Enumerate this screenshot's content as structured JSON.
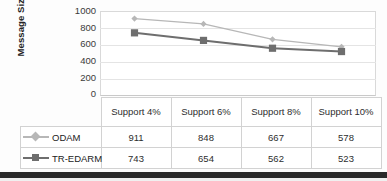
{
  "chart_data": {
    "type": "line",
    "title": "",
    "xlabel": "",
    "ylabel": "Message Size",
    "ylim": [
      0,
      1000
    ],
    "y_ticks": [
      1000,
      800,
      600,
      400,
      200,
      0
    ],
    "grid": true,
    "legend_position": "data-table-left",
    "categories": [
      "Support 4%",
      "Support 6%",
      "Support 8%",
      "Support 10%"
    ],
    "series": [
      {
        "name": "ODAM",
        "values": [
          911,
          848,
          667,
          578
        ],
        "color": "#b7b7b7",
        "marker": "diamond"
      },
      {
        "name": "TR-EDARM",
        "values": [
          743,
          654,
          562,
          523
        ],
        "color": "#6e6e6e",
        "marker": "square"
      }
    ]
  },
  "axis": {
    "y_title": "Message Size",
    "y_tick_labels": [
      "1000",
      "800",
      "600",
      "400",
      "200",
      "0"
    ]
  },
  "table": {
    "category_headers": [
      "Support 4%",
      "Support 6%",
      "Support 8%",
      "Support 10%"
    ],
    "rows": [
      {
        "label": "ODAM",
        "values": [
          "911",
          "848",
          "667",
          "578"
        ]
      },
      {
        "label": "TR-EDARM",
        "values": [
          "743",
          "654",
          "562",
          "523"
        ]
      }
    ]
  },
  "colors": {
    "series_odam": "#b7b7b7",
    "series_tredarm": "#6e6e6e",
    "gridline": "#e4e4e4",
    "table_border": "#d2d2d2"
  }
}
